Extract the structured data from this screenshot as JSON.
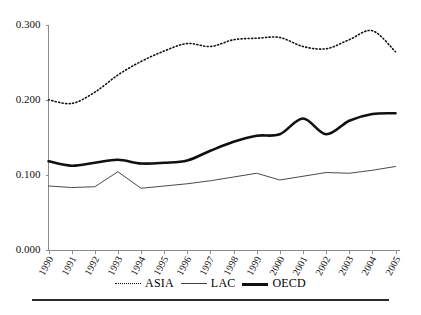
{
  "chart_data": {
    "type": "line",
    "title": "",
    "subtitle": "",
    "xlabel": "",
    "ylabel": "",
    "categories": [
      "1990",
      "1991",
      "1992",
      "1993",
      "1994",
      "1995",
      "1996",
      "1997",
      "1998",
      "1999",
      "2000",
      "2001",
      "2002",
      "2003",
      "2004",
      "2005"
    ],
    "x": [
      1990,
      1991,
      1992,
      1993,
      1994,
      1995,
      1996,
      1997,
      1998,
      1999,
      2000,
      2001,
      2002,
      2003,
      2004,
      2005
    ],
    "ylim": [
      0.0,
      0.3
    ],
    "xlim": [
      1990,
      2005
    ],
    "yticks": [
      0.0,
      0.1,
      0.2,
      0.3
    ],
    "ytick_labels": [
      "0.000",
      "0.100",
      "0.200",
      "0.300"
    ],
    "grid": false,
    "legend_position": "bottom-center",
    "series": [
      {
        "name": "ASIA",
        "style": "dotted",
        "color": "#101010",
        "values": [
          0.201,
          0.196,
          0.211,
          0.234,
          0.252,
          0.266,
          0.276,
          0.272,
          0.281,
          0.283,
          0.284,
          0.272,
          0.269,
          0.281,
          0.293,
          0.265
        ]
      },
      {
        "name": "LAC",
        "style": "thin-solid",
        "color": "#4a4a4a",
        "values": [
          0.086,
          0.084,
          0.085,
          0.105,
          0.083,
          0.086,
          0.089,
          0.093,
          0.098,
          0.103,
          0.094,
          0.099,
          0.104,
          0.103,
          0.107,
          0.112
        ]
      },
      {
        "name": "OECD",
        "style": "thick-solid",
        "color": "#101010",
        "values": [
          0.119,
          0.113,
          0.117,
          0.121,
          0.116,
          0.117,
          0.12,
          0.133,
          0.145,
          0.153,
          0.155,
          0.176,
          0.155,
          0.173,
          0.182,
          0.183
        ]
      }
    ]
  },
  "legend": {
    "items": [
      {
        "label": "ASIA",
        "swatch": "dotted"
      },
      {
        "label": "LAC",
        "swatch": "thin-solid"
      },
      {
        "label": "OECD",
        "swatch": "thick-solid"
      }
    ]
  }
}
